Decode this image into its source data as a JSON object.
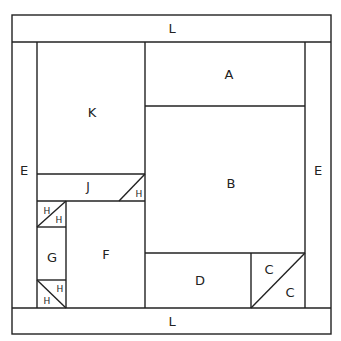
{
  "pieces": {
    "L_top": "L",
    "L_bottom": "L",
    "E_left": "E",
    "E_right": "E",
    "A": "A",
    "B": "B",
    "K": "K",
    "J": "J",
    "H_j": "H",
    "H1a": "H",
    "H1b": "H",
    "G": "G",
    "H2a": "H",
    "H2b": "H",
    "F": "F",
    "D": "D",
    "C1": "C",
    "C2": "C"
  },
  "colors": {
    "line": "#222222",
    "background": "#ffffff"
  }
}
